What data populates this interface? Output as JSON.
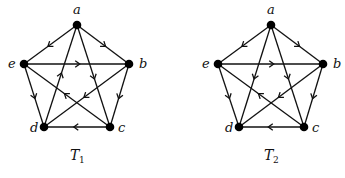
{
  "figure": {
    "graphs": [
      {
        "id": "T1",
        "caption": "T",
        "caption_sub": "1",
        "caption_pos": [
          70,
          160
        ],
        "nodes": {
          "a": [
            77,
            25
          ],
          "b": [
            129,
            64
          ],
          "c": [
            110,
            127
          ],
          "d": [
            44,
            127
          ],
          "e": [
            24,
            64
          ]
        },
        "label_pos": {
          "a": [
            73,
            14
          ],
          "b": [
            139,
            68
          ],
          "c": [
            118,
            132
          ],
          "d": [
            30,
            132
          ],
          "e": [
            8,
            68
          ]
        },
        "edges": [
          [
            "a",
            "e"
          ],
          [
            "a",
            "b"
          ],
          [
            "e",
            "b"
          ],
          [
            "d",
            "a"
          ],
          [
            "a",
            "c"
          ],
          [
            "e",
            "d"
          ],
          [
            "b",
            "c"
          ],
          [
            "c",
            "d"
          ],
          [
            "c",
            "e"
          ],
          [
            "b",
            "d"
          ]
        ]
      },
      {
        "id": "T2",
        "caption": "T",
        "caption_sub": "2",
        "caption_pos": [
          264,
          160
        ],
        "nodes": {
          "a": [
            271,
            25
          ],
          "b": [
            323,
            64
          ],
          "c": [
            304,
            127
          ],
          "d": [
            239,
            127
          ],
          "e": [
            218,
            64
          ]
        },
        "label_pos": {
          "a": [
            267,
            14
          ],
          "b": [
            333,
            68
          ],
          "c": [
            312,
            132
          ],
          "d": [
            225,
            132
          ],
          "e": [
            202,
            68
          ]
        },
        "edges": [
          [
            "a",
            "e"
          ],
          [
            "a",
            "b"
          ],
          [
            "e",
            "b"
          ],
          [
            "a",
            "d"
          ],
          [
            "a",
            "c"
          ],
          [
            "e",
            "d"
          ],
          [
            "b",
            "c"
          ],
          [
            "c",
            "d"
          ],
          [
            "c",
            "e"
          ],
          [
            "b",
            "d"
          ]
        ]
      }
    ],
    "node_labels": [
      "a",
      "b",
      "c",
      "d",
      "e"
    ]
  }
}
